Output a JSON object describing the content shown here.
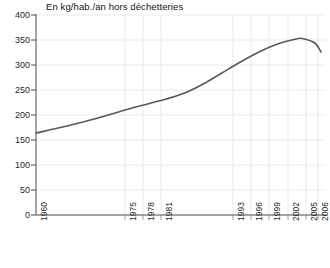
{
  "chart_data": {
    "type": "line",
    "title": "En kg/hab./an hors déchetteries",
    "xlabel": "",
    "ylabel": "",
    "ylim": [
      0,
      400
    ],
    "ytick_step": 50,
    "yticks": [
      400,
      350,
      300,
      250,
      200,
      150,
      100,
      50,
      0
    ],
    "grid": true,
    "legend": "none",
    "xlim": [
      1960,
      2006
    ],
    "xtick_labels": [
      "1960",
      "1975",
      "1978",
      "1981",
      "1993",
      "1996",
      "1999",
      "2002",
      "2005",
      "2006"
    ],
    "xticks": [
      1960,
      1975,
      1978,
      1981,
      1993,
      1996,
      1999,
      2002,
      2005,
      2006
    ],
    "series": [
      {
        "name": "Ordures ménagères",
        "color": "#595959",
        "x": [
          1960,
          1965,
          1970,
          1975,
          1978,
          1981,
          1984,
          1987,
          1990,
          1993,
          1996,
          1999,
          2002,
          2003,
          2005,
          2006
        ],
        "values": [
          164,
          178,
          194,
          212,
          222,
          232,
          244,
          262,
          284,
          306,
          326,
          342,
          352,
          353,
          344,
          326
        ]
      }
    ],
    "annotations": []
  },
  "axis": {
    "y_values": [
      "400",
      "350",
      "300",
      "250",
      "200",
      "150",
      "100",
      "50",
      "0"
    ],
    "x_values": [
      "1960",
      "1975",
      "1978",
      "1981",
      "1993",
      "1996",
      "1999",
      "2002",
      "2005",
      "2006"
    ]
  },
  "colors": {
    "line": "#595959",
    "grid": "#d8dce6",
    "axis": "#555555",
    "background": "#ffffff",
    "text": "#1a1a1a"
  }
}
